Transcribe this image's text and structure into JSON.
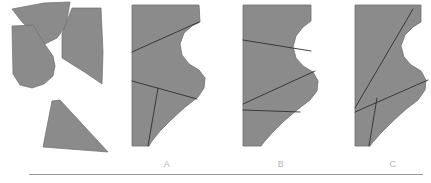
{
  "figure": {
    "background_color": "#ffffff",
    "piece_fill_color": "#8b8b8b",
    "piece_outline_color": "#6f6f6f",
    "cut_line_color": "#2f2f2f",
    "label_color": "#b4b4b4",
    "rule_color": "#9a9a9a",
    "width": 431,
    "height": 183
  },
  "prompt_group": {
    "name": "scattered-pieces",
    "piece_count": 4,
    "pieces": [
      {
        "id": "piece-1",
        "name": "top-left-wedge",
        "points": "12,9 44,3 70,2 66,26 57,38 45,44 22,22"
      },
      {
        "id": "piece-2",
        "name": "left-curved-piece",
        "points": "12,26 33,25 46,46 53,56 55,66 53,76 44,84 32,88 20,85 13,74"
      },
      {
        "id": "piece-3",
        "name": "right-concave-piece",
        "points": "72,8 101,8 103,52 102,84 86,73 70,63 62,58 62,34"
      },
      {
        "id": "piece-4",
        "name": "bottom-triangle",
        "points": "43,147 52,101 60,100 108,152"
      }
    ]
  },
  "options": [
    {
      "id": "option-a",
      "label": "A",
      "label_x": 167,
      "label_y": 166,
      "outline": "132,5 199,5 200,22 192,26 184,33 180,44 182,55 189,64 199,70 205,78 204,88 198,97 184,108 171,120 160,131 152,141 149,146 132,146",
      "cut_lines": [
        "132,52 199,22",
        "132,81 197,99",
        "158,88 148,146"
      ]
    },
    {
      "id": "option-b",
      "label": "B",
      "label_x": 281,
      "label_y": 166,
      "outline": "243,5 311,5 311,21 303,27 296,36 293,47 296,58 303,66 313,72 318,81 317,91 310,100 297,110 283,122 272,133 264,142 261,146 243,146",
      "cut_lines": [
        "243,40 311,51",
        "243,104 315,71",
        "243,110 300,112"
      ]
    },
    {
      "id": "option-c",
      "label": "C",
      "label_x": 393,
      "label_y": 166,
      "outline": "355,5 421,5 421,22 413,27 405,35 401,46 404,57 411,65 421,71 426,80 425,90 418,100 405,110 392,122 381,133 373,142 370,146 355,146",
      "cut_lines": [
        "355,108 413,9",
        "355,112 428,80",
        "377,98 369,146"
      ]
    }
  ],
  "bottom_rule": {
    "name": "horizontal-divider",
    "x": 29,
    "y": 174,
    "width": 394
  }
}
